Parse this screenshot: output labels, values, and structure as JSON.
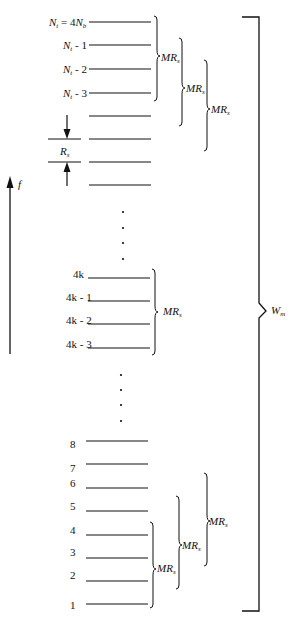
{
  "diagram": {
    "axis": {
      "label": "f",
      "direction": "up"
    },
    "spacing_label": "R_s",
    "span_label": "W_m",
    "group_label": "MR_s",
    "top_levels": [
      {
        "label_main": "N",
        "label_sub": "t",
        "label_rest": " = 4N",
        "label_sub2": "b",
        "y": 22
      },
      {
        "label_main": "N",
        "label_sub": "t",
        "label_rest": " - 1",
        "y": 45
      },
      {
        "label_main": "N",
        "label_sub": "t",
        "label_rest": " - 2",
        "y": 69
      },
      {
        "label_main": "N",
        "label_sub": "t",
        "label_rest": " - 3",
        "y": 93
      },
      {
        "y": 116
      },
      {
        "y": 139
      },
      {
        "y": 162
      },
      {
        "y": 185
      }
    ],
    "middle_levels": [
      {
        "label": "4k",
        "y": 278
      },
      {
        "label": "4k - 1",
        "y": 301
      },
      {
        "label": "4k - 2",
        "y": 324
      },
      {
        "label": "4k - 3",
        "y": 348
      }
    ],
    "bottom_levels": [
      {
        "label": "8",
        "y": 441
      },
      {
        "label": "7",
        "y": 464
      },
      {
        "label": "6",
        "y": 488
      },
      {
        "label": "5",
        "y": 511
      },
      {
        "label": "4",
        "y": 535
      },
      {
        "label": "3",
        "y": 558
      },
      {
        "label": "2",
        "y": 581
      },
      {
        "label": "1",
        "y": 604
      }
    ],
    "ellipsis_dots": [
      {
        "x": 123,
        "y": 212
      },
      {
        "x": 123,
        "y": 228
      },
      {
        "x": 123,
        "y": 243
      },
      {
        "x": 123,
        "y": 259
      },
      {
        "x": 121,
        "y": 375
      },
      {
        "x": 121,
        "y": 390
      },
      {
        "x": 121,
        "y": 405
      },
      {
        "x": 121,
        "y": 421
      }
    ]
  }
}
